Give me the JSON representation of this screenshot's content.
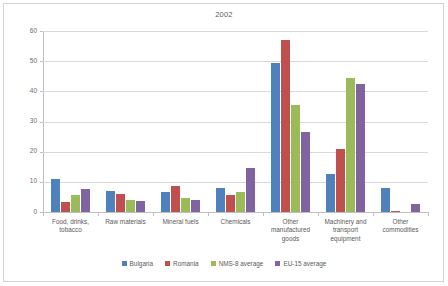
{
  "chart_data": {
    "type": "bar",
    "title": "2002",
    "xlabel": "",
    "ylabel": "",
    "ylim": [
      0,
      60
    ],
    "yticks": [
      0,
      10,
      20,
      30,
      40,
      50,
      60
    ],
    "grid": true,
    "legend_position": "bottom",
    "categories": [
      "Food, drinks, tobacco",
      "Raw materials",
      "Mineral fuels",
      "Chemicals",
      "Other manufactured goods",
      "Machinery and transport equipment",
      "Other commodities"
    ],
    "category_lines": [
      [
        "Food, drinks,",
        "tobacco"
      ],
      [
        "Raw materials"
      ],
      [
        "Mineral fuels"
      ],
      [
        "Chemicals"
      ],
      [
        "Other",
        "manufactured",
        "goods"
      ],
      [
        "Machinery and",
        "transport",
        "equipment"
      ],
      [
        "Other",
        "commodities"
      ]
    ],
    "series": [
      {
        "name": "Bulgaria",
        "color": "#4F81BD",
        "values": [
          10.8,
          7.0,
          6.5,
          8.0,
          49.5,
          12.5,
          8.0
        ]
      },
      {
        "name": "Romania",
        "color": "#C0504D",
        "values": [
          3.2,
          6.0,
          8.5,
          5.5,
          57.0,
          21.0,
          0.3
        ]
      },
      {
        "name": "NMS-8 average",
        "color": "#9BBB59",
        "values": [
          5.8,
          4.0,
          4.5,
          6.5,
          35.5,
          44.5,
          0.0
        ]
      },
      {
        "name": "EU-15 average",
        "color": "#8064A2",
        "values": [
          7.5,
          3.5,
          4.0,
          14.5,
          26.5,
          42.5,
          2.5
        ]
      }
    ]
  },
  "colors": {
    "bulgaria": "#4F81BD",
    "romania": "#C0504D",
    "nms8": "#9BBB59",
    "eu15": "#8064A2",
    "gridline": "#D9D9D9",
    "axis": "#BFBFBF",
    "border": "#D4D4D4",
    "text": "#5A5A5A"
  }
}
